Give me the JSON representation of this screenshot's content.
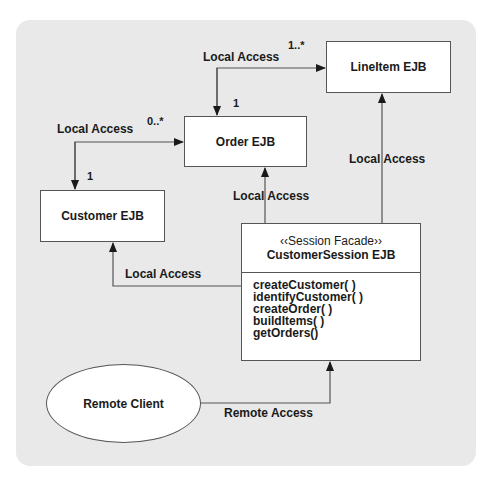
{
  "diagram": {
    "type": "UML class/component diagram - Session Facade pattern",
    "nodes": {
      "lineitem": {
        "label": "LineItem EJB"
      },
      "order": {
        "label": "Order EJB"
      },
      "customer": {
        "label": "Customer EJB"
      },
      "session": {
        "stereotype": "‹‹Session Facade››",
        "label": "CustomerSession EJB",
        "operations": [
          "createCustomer( )",
          "identifyCustomer( )",
          "createOrder( )",
          "buildItems( )",
          "getOrders()"
        ]
      },
      "client": {
        "label": "Remote Client"
      }
    },
    "edges": [
      {
        "from": "order",
        "to": "lineitem",
        "label": "Local Access",
        "mult_from": "1",
        "mult_to": "1..*"
      },
      {
        "from": "customer",
        "to": "order",
        "label": "Local Access",
        "mult_from": "1",
        "mult_to": "0..*"
      },
      {
        "from": "session",
        "to": "order",
        "label": "Local Access"
      },
      {
        "from": "session",
        "to": "lineitem",
        "label": "Local Access"
      },
      {
        "from": "session",
        "to": "customer",
        "label": "Local Access"
      },
      {
        "from": "client",
        "to": "session",
        "label": "Remote Access"
      }
    ]
  },
  "colors": {
    "panel": "#e9e9e9",
    "box": "#ffffff",
    "line": "#555555"
  }
}
